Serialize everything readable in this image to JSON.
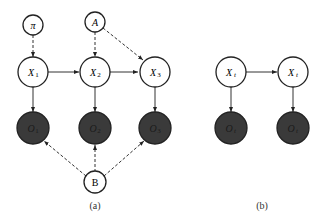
{
  "diagram_a": {
    "caption": "(a)",
    "nodes": {
      "pi": {
        "label": "π",
        "type": "parameter"
      },
      "A": {
        "label": "A",
        "type": "parameter"
      },
      "X1": {
        "label": "X",
        "sub": "1",
        "type": "hidden"
      },
      "X2": {
        "label": "X",
        "sub": "2",
        "type": "hidden"
      },
      "X3": {
        "label": "X",
        "sub": "3",
        "type": "hidden"
      },
      "O1": {
        "label": "O",
        "sub": "1",
        "type": "observed"
      },
      "O2": {
        "label": "O",
        "sub": "2",
        "type": "observed"
      },
      "O3": {
        "label": "O",
        "sub": "3",
        "type": "observed"
      },
      "B": {
        "label": "B",
        "type": "parameter"
      }
    },
    "edges": [
      {
        "from": "pi",
        "to": "X1",
        "style": "dashed"
      },
      {
        "from": "A",
        "to": "X2",
        "style": "dashed"
      },
      {
        "from": "A",
        "to": "X3",
        "style": "dashed"
      },
      {
        "from": "X1",
        "to": "X2",
        "style": "solid"
      },
      {
        "from": "X2",
        "to": "X3",
        "style": "solid"
      },
      {
        "from": "X1",
        "to": "O1",
        "style": "solid"
      },
      {
        "from": "X2",
        "to": "O2",
        "style": "solid"
      },
      {
        "from": "X3",
        "to": "O3",
        "style": "solid"
      },
      {
        "from": "B",
        "to": "O1",
        "style": "dashed"
      },
      {
        "from": "B",
        "to": "O2",
        "style": "dashed"
      },
      {
        "from": "B",
        "to": "O3",
        "style": "dashed"
      }
    ]
  },
  "diagram_b": {
    "caption": "(b)",
    "nodes": {
      "Xt1": {
        "label": "X",
        "sub": "t",
        "type": "hidden"
      },
      "Xt2": {
        "label": "X",
        "sub": "t",
        "type": "hidden"
      },
      "Ot1": {
        "label": "O",
        "sub": "t",
        "type": "observed"
      },
      "Ot2": {
        "label": "O",
        "sub": "t",
        "type": "observed"
      }
    },
    "edges": [
      {
        "from": "Xt1",
        "to": "Xt2",
        "style": "solid"
      },
      {
        "from": "Xt1",
        "to": "Ot1",
        "style": "solid"
      },
      {
        "from": "Xt2",
        "to": "Ot2",
        "style": "solid"
      }
    ]
  },
  "colors": {
    "observed_fill": "#3a3a3a",
    "stroke": "#222222",
    "hidden_fill": "#ffffff"
  }
}
